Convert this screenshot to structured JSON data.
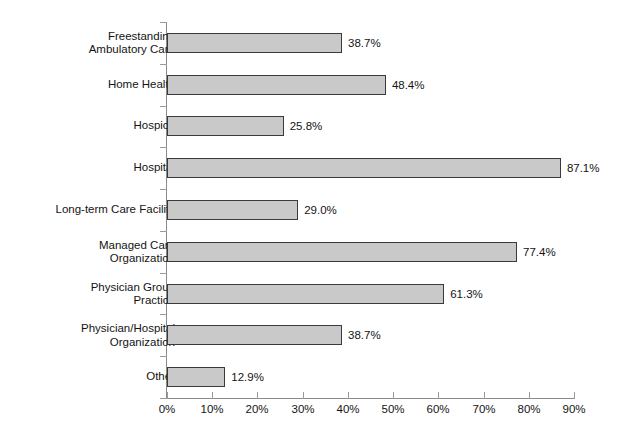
{
  "chart_data": {
    "type": "bar",
    "orientation": "horizontal",
    "title": "",
    "xlabel": "",
    "ylabel": "",
    "xlim": [
      0,
      90
    ],
    "grid": false,
    "legend": null,
    "value_suffix": "%",
    "categories": [
      "Freestanding\nAmbulatory Care",
      "Home Health",
      "Hospice",
      "Hospital",
      "Long-term Care Facility",
      "Managed Care\nOrganization",
      "Physician Group\nPractice",
      "Physician/Hospital\nOrganization",
      "Other"
    ],
    "values": [
      38.7,
      48.4,
      25.8,
      87.1,
      29.0,
      77.4,
      61.3,
      38.7,
      12.9
    ],
    "value_labels": [
      "38.7%",
      "48.4%",
      "25.8%",
      "87.1%",
      "29.0%",
      "77.4%",
      "61.3%",
      "38.7%",
      "12.9%"
    ],
    "x_ticks": [
      0,
      10,
      20,
      30,
      40,
      50,
      60,
      70,
      80,
      90
    ],
    "x_tick_labels": [
      "0%",
      "10%",
      "20%",
      "30%",
      "40%",
      "50%",
      "60%",
      "70%",
      "80%",
      "90%"
    ],
    "colors": {
      "bar_fill": "#c9c9c9",
      "bar_border": "#3a3a3a",
      "axis": "#8a8a8a",
      "text": "#141414",
      "background": "#ffffff"
    }
  }
}
